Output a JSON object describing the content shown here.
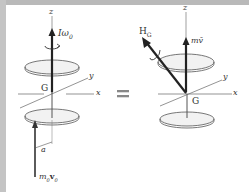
{
  "diagram": {
    "type": "rigid-body-momentum-equivalence",
    "colors": {
      "frame": "#b9b9b9",
      "ink": "#333333",
      "disk_fill": "#efefef"
    },
    "left_figure": {
      "axis_z": "z",
      "axis_y": "y",
      "axis_x": "x",
      "center": "G",
      "angular_momentum_label": "Iω",
      "angular_momentum_subscript": "0",
      "impulse_label": "m",
      "impulse_sub1": "0",
      "impulse_vec": "v",
      "impulse_sub2": "0",
      "offset_label": "a"
    },
    "equals_sign": "=",
    "right_figure": {
      "axis_z": "z",
      "axis_y": "y",
      "axis_x": "x",
      "center": "G",
      "angular_momentum_label": "H",
      "angular_momentum_subscript": "G",
      "linear_momentum_label": "mv̄"
    }
  }
}
